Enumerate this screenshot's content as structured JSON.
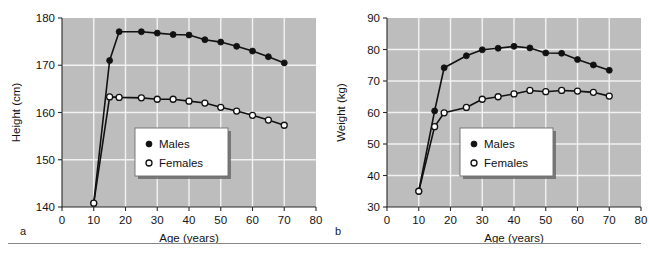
{
  "figure": {
    "panels": [
      {
        "letter": "a",
        "chart_data": {
          "type": "line",
          "title": "",
          "xlabel": "Age (years)",
          "ylabel": "Height (cm)",
          "xlim": [
            0,
            80
          ],
          "ylim": [
            140,
            180
          ],
          "xticks": [
            0,
            10,
            20,
            30,
            40,
            50,
            60,
            70,
            80
          ],
          "yticks": [
            140,
            150,
            160,
            170,
            180
          ],
          "grid": true,
          "legend_position": "center",
          "series": [
            {
              "name": "Males",
              "marker": "filled-circle",
              "x": [
                10,
                15,
                18,
                25,
                30,
                35,
                40,
                45,
                50,
                55,
                60,
                65,
                70
              ],
              "values": [
                140.8,
                171.0,
                177.1,
                177.1,
                176.8,
                176.5,
                176.4,
                175.4,
                174.9,
                174.0,
                173.0,
                171.8,
                170.5
              ]
            },
            {
              "name": "Females",
              "marker": "open-circle",
              "x": [
                10,
                15,
                18,
                25,
                30,
                35,
                40,
                45,
                50,
                55,
                60,
                65,
                70
              ],
              "values": [
                140.8,
                163.3,
                163.2,
                163.1,
                162.8,
                162.8,
                162.4,
                162.0,
                161.1,
                160.3,
                159.4,
                158.4,
                157.3
              ]
            }
          ]
        }
      },
      {
        "letter": "b",
        "chart_data": {
          "type": "line",
          "title": "",
          "xlabel": "Age (years)",
          "ylabel": "Weight (kg)",
          "xlim": [
            0,
            80
          ],
          "ylim": [
            30,
            90
          ],
          "xticks": [
            0,
            10,
            20,
            30,
            40,
            50,
            60,
            70,
            80
          ],
          "yticks": [
            30,
            40,
            50,
            60,
            70,
            80,
            90
          ],
          "grid": true,
          "legend_position": "center",
          "series": [
            {
              "name": "Males",
              "marker": "filled-circle",
              "x": [
                10,
                15,
                18,
                25,
                30,
                35,
                40,
                45,
                50,
                55,
                60,
                65,
                70
              ],
              "values": [
                35.0,
                60.5,
                74.2,
                78.0,
                79.9,
                80.4,
                81.0,
                80.5,
                78.9,
                78.8,
                76.8,
                75.1,
                73.4
              ]
            },
            {
              "name": "Females",
              "marker": "open-circle",
              "x": [
                10,
                15,
                18,
                25,
                30,
                35,
                40,
                45,
                50,
                55,
                60,
                65,
                70
              ],
              "values": [
                35.0,
                55.5,
                59.9,
                61.6,
                64.2,
                65.0,
                65.9,
                67.0,
                66.6,
                67.0,
                66.8,
                66.4,
                65.2
              ]
            }
          ]
        }
      }
    ],
    "legend_labels": {
      "males": "Males",
      "females": "Females"
    },
    "colors": {
      "plot_background": "#bdbdbd",
      "gridline": "#f2f2f2",
      "line": "#111111",
      "axis": "#2b2b2b",
      "text": "#141414",
      "legend_background": "#ffffff",
      "rule": "#888888"
    }
  }
}
